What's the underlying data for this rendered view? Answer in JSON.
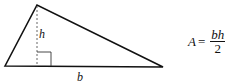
{
  "diagram": {
    "labels": {
      "height": "h",
      "base": "b"
    },
    "formula": {
      "lhs": "A",
      "equals": "=",
      "numerator": "bh",
      "denominator": "2"
    },
    "colors": {
      "stroke": "#111111",
      "background": "#ffffff"
    }
  }
}
